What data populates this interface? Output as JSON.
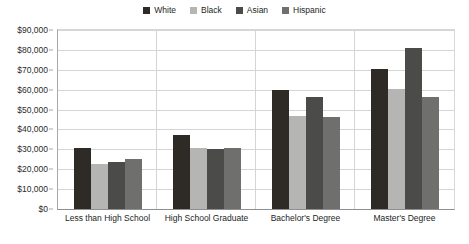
{
  "chart_data": {
    "type": "bar",
    "title": "",
    "subtitle": "",
    "xlabel": "",
    "ylabel": "",
    "categories": [
      "Less than High School",
      "High School Graduate",
      "Bachelor's Degree",
      "Master's Degree"
    ],
    "series": [
      {
        "name": "White",
        "color": "#2e2a26",
        "values": [
          30500,
          37200,
          60000,
          70200
        ]
      },
      {
        "name": "Black",
        "color": "#b5b5b3",
        "values": [
          22500,
          30800,
          47000,
          60300
        ]
      },
      {
        "name": "Asian",
        "color": "#4b4b49",
        "values": [
          23800,
          30100,
          56300,
          81000
        ]
      },
      {
        "name": "Hispanic",
        "color": "#6f6f6d",
        "values": [
          25000,
          30700,
          46500,
          56200
        ]
      }
    ],
    "ylim": [
      0,
      90000
    ],
    "ytick_values": [
      0,
      10000,
      20000,
      30000,
      40000,
      50000,
      60000,
      70000,
      80000,
      90000
    ],
    "ytick_labels": [
      "$0",
      "$10,000",
      "$20,000",
      "$30,000",
      "$40,000",
      "$50,000",
      "$60,000",
      "$70,000",
      "$80,000",
      "$90,000"
    ],
    "grid": true,
    "legend_position": "top-center",
    "legend_entries": [
      "White",
      "Black",
      "Asian",
      "Hispanic"
    ]
  }
}
